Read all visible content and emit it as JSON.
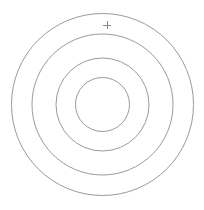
{
  "target": {
    "center": {
      "x": 102.5,
      "y": 104.5
    },
    "stroke_color": "#9a9a9a",
    "background": "#ffffff",
    "rings": [
      {
        "name": "ring-outer",
        "r": 91
      },
      {
        "name": "ring-second",
        "r": 70.5
      },
      {
        "name": "ring-third",
        "r": 46.5
      },
      {
        "name": "ring-inner",
        "r": 27
      }
    ]
  },
  "cursor": {
    "icon": "crosshair-icon",
    "x": 107,
    "y": 25,
    "size": 8,
    "color": "#8a8a8a"
  }
}
